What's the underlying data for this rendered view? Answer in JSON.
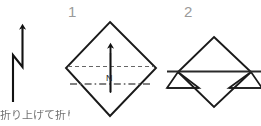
{
  "canvas": {
    "width": 261,
    "height": 126,
    "background": "#ffffff",
    "description": "Origami folding instruction diagram: an orientation arrow marker and two numbered folding steps"
  },
  "palette": {
    "line_stroke": "#1a1a1a",
    "guide_stroke": "#555555",
    "step_number_color": "#9a9a9a",
    "caption_color": "#3a3a3a"
  },
  "steps": [
    {
      "number": "1",
      "label_name": "step-number-1"
    },
    {
      "number": "2",
      "label_name": "step-number-2"
    }
  ],
  "orientation_marker": {
    "name": "north-arrow-marker",
    "letter": "",
    "shape": "zigzag-n-with-arrowhead"
  },
  "step1": {
    "shape": "diamond-square-rotated-45",
    "axis_letter": "N",
    "arrow": "upward-arrow",
    "guides": [
      {
        "name": "horizontal-dashed-fold-line",
        "style": "dashed"
      },
      {
        "name": "horizontal-dash-dot-center-line",
        "style": "dash-dot"
      }
    ]
  },
  "step2": {
    "shape": "diamond-with-two-folded-side-triangles",
    "guides": [
      {
        "name": "horizontal-fold-edge",
        "style": "solid"
      }
    ]
  },
  "caption": {
    "text": "折り上げて折り目を"
  }
}
